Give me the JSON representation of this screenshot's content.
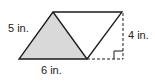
{
  "diagram": {
    "type": "geometry",
    "shape": "parallelogram",
    "labels": {
      "side": "5 in.",
      "height": "4 in.",
      "base": "6 in."
    },
    "colors": {
      "stroke": "#1a1a1a",
      "shaded_triangle": "#d9d9d9",
      "background": "#ffffff"
    }
  }
}
